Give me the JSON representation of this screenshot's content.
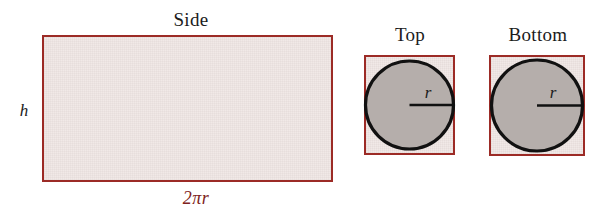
{
  "figure": {
    "background_color": "#ffffff",
    "outline_color": "#9c2b26",
    "fill_color_rectangle": "#f1e9e7",
    "fill_color_circle": "#b5aeab",
    "circle_stroke_color": "#111111",
    "label_color": "#1b1b1b",
    "dimension_label_color": "#7e2220"
  },
  "panels": {
    "side": {
      "title": "Side",
      "height_label": "h",
      "width_label": "2πr"
    },
    "top": {
      "title": "Top",
      "radius_label": "r"
    },
    "bottom": {
      "title": "Bottom",
      "radius_label": "r"
    }
  }
}
